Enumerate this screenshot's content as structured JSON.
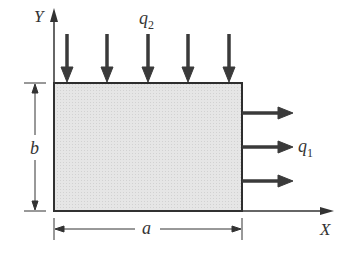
{
  "diagram": {
    "type": "plate-loading",
    "axes": {
      "y_label": "Y",
      "x_label": "X"
    },
    "loads": {
      "top": {
        "symbol": "q",
        "subscript": "2",
        "arrow_count": 5,
        "direction": "down"
      },
      "right": {
        "symbol": "q",
        "subscript": "1",
        "arrow_count": 3,
        "direction": "right"
      }
    },
    "dimensions": {
      "height_label": "b",
      "width_label": "a"
    },
    "colors": {
      "plate_fill": "#e4e4e4",
      "stroke": "#333333",
      "arrow": "#3a3a3a"
    }
  }
}
